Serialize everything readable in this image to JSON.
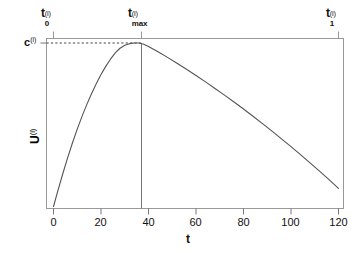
{
  "chart_data": {
    "type": "line",
    "title": "",
    "subtitle": "",
    "xlabel": "t",
    "ylabel": "U(i)",
    "ylabel_base": "U",
    "ylabel_sup": "(i)",
    "xlim": [
      -5,
      127
    ],
    "ylim": [
      0,
      1.06
    ],
    "grid": false,
    "legend": null,
    "x_ticks": [
      0,
      20,
      40,
      60,
      80,
      100,
      120
    ],
    "x_tick_labels": [
      "0",
      "20",
      "40",
      "60",
      "80",
      "100",
      "120"
    ],
    "y_ticks": [],
    "y_tick_labels": [],
    "series": [
      {
        "name": "U(i)(t)",
        "x": [
          0,
          2,
          4,
          6,
          8,
          10,
          12,
          14,
          16,
          18,
          20,
          22,
          24,
          26,
          28,
          30,
          32,
          34,
          36,
          38,
          40,
          44,
          48,
          52,
          56,
          60,
          64,
          68,
          72,
          76,
          80,
          84,
          88,
          92,
          96,
          100,
          104,
          108,
          112,
          116,
          120
        ],
        "y": [
          0.0,
          0.105,
          0.205,
          0.3,
          0.39,
          0.473,
          0.551,
          0.623,
          0.69,
          0.751,
          0.807,
          0.857,
          0.901,
          0.94,
          0.968,
          0.986,
          0.996,
          1.0,
          1.0,
          0.992,
          0.979,
          0.947,
          0.912,
          0.876,
          0.839,
          0.801,
          0.762,
          0.722,
          0.681,
          0.639,
          0.596,
          0.552,
          0.507,
          0.461,
          0.414,
          0.366,
          0.317,
          0.267,
          0.216,
          0.164,
          0.111
        ]
      }
    ],
    "annotations": {
      "t0": {
        "label_base": "t",
        "label_sub": "0",
        "label_sup": "(i)",
        "x": 0,
        "description": "start time marker at top axis"
      },
      "tmax": {
        "label_base": "t",
        "label_sub": "max",
        "label_sup": "(i)",
        "x": 36,
        "description": "time of maximum utility, vertical line to peak"
      },
      "t1": {
        "label_base": "t",
        "label_sub": "1",
        "label_sup": "(i)",
        "x": 120,
        "description": "end time marker at top axis"
      },
      "c": {
        "label_base": "c",
        "label_sup": "(i)",
        "y": 1.0,
        "description": "peak utility value, dashed horizontal line"
      }
    },
    "styles": {
      "curve_color": "#555555",
      "axis_color": "#999999",
      "marker_line_color": "#888888",
      "dashed_line_color": "#555555",
      "background": "#ffffff"
    }
  }
}
